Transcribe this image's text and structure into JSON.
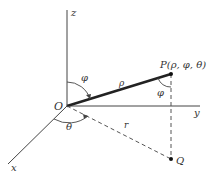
{
  "diagram": {
    "axes": {
      "z": {
        "label": "z"
      },
      "y": {
        "label": "y"
      },
      "x": {
        "label": "x"
      }
    },
    "points": {
      "origin": {
        "label": "O"
      },
      "P": {
        "label": "P(ρ, φ, θ)"
      },
      "Q": {
        "label": "Q"
      }
    },
    "segments": {
      "rho": {
        "label": "ρ"
      },
      "r": {
        "label": "r"
      }
    },
    "angles": {
      "phi_at_origin": {
        "label": "φ"
      },
      "phi_at_P": {
        "label": "φ"
      },
      "theta": {
        "label": "θ"
      }
    },
    "colors": {
      "axis": "#444444",
      "rho_segment": "#222222",
      "dashed": "#555555",
      "text": "#333333"
    }
  }
}
